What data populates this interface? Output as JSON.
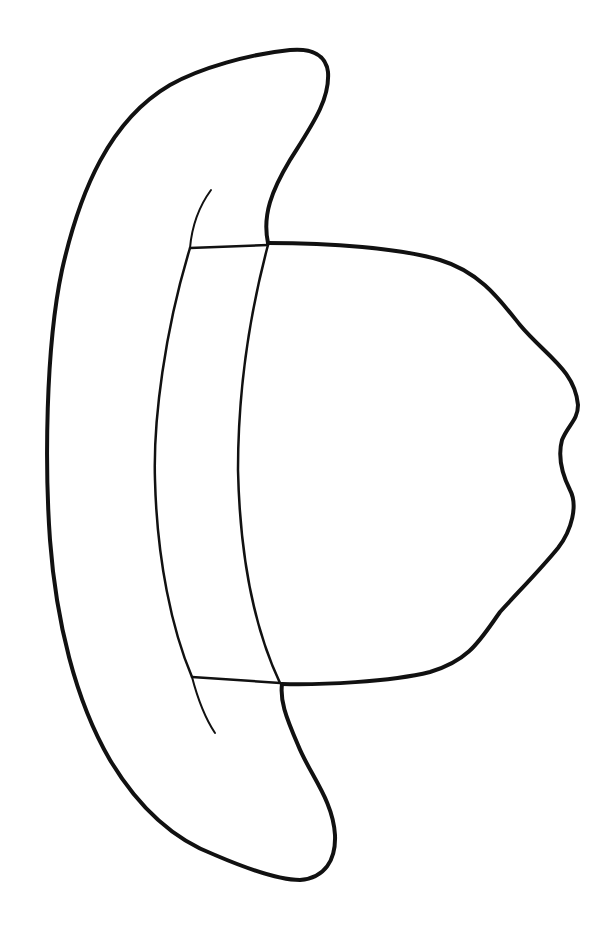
{
  "image": {
    "subject": "cowboy hat outline (rotated 90°, crown pointing right)",
    "style": "black line drawing on white",
    "stroke_color": "#111111",
    "background_color": "#ffffff",
    "parts": [
      "brim",
      "hatband",
      "crown"
    ]
  }
}
